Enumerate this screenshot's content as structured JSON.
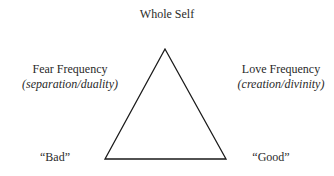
{
  "diagram": {
    "top_label": "Whole Self",
    "left": {
      "title": "Fear Frequency",
      "subtitle": "(separation/duality)"
    },
    "right": {
      "title": "Love Frequency",
      "subtitle": "(creation/divinity)"
    },
    "bottom_left_label": "“Bad”",
    "bottom_right_label": "“Good”",
    "shape": "triangle",
    "stroke_color": "#1a1a1a"
  }
}
